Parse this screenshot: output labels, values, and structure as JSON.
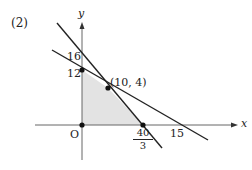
{
  "problem_label": "(2)",
  "axes": {
    "x_label": "x",
    "y_label": "y",
    "origin_label": "O"
  },
  "y_ticks": {
    "top": "16",
    "bottom": "12"
  },
  "x_ticks": {
    "frac_num": "40",
    "frac_den": "3",
    "right": "15"
  },
  "point_label": "(10, 4)",
  "colors": {
    "line": "#222222",
    "axis": "#555555",
    "fill": "#e3e3e3"
  },
  "lines": [
    {
      "name": "steep",
      "eq": "6x + 5y = 80",
      "through": [
        [
          0,
          16
        ],
        [
          10,
          4
        ],
        [
          13.33,
          0
        ]
      ]
    },
    {
      "name": "shallow",
      "eq": "4x + 15y = 60 / x + 2.5y...",
      "through": [
        [
          0,
          12
        ],
        [
          10,
          4
        ],
        [
          15,
          0
        ]
      ]
    }
  ],
  "feasible_region_vertices": [
    [
      0,
      0
    ],
    [
      0,
      12
    ],
    [
      10,
      4
    ],
    [
      13.33,
      0
    ]
  ]
}
